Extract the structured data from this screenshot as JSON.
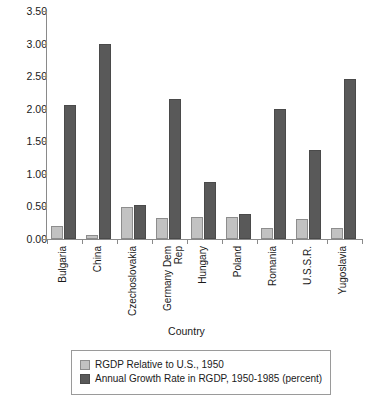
{
  "chart_data": {
    "type": "bar",
    "title": "",
    "xlabel": "Country",
    "ylabel": "",
    "ylim": [
      0.0,
      3.5
    ],
    "ytick_labels": [
      "0.00",
      "0.50",
      "1.00",
      "1.50",
      "2.00",
      "2.50",
      "3.00",
      "3.50"
    ],
    "ytick_values": [
      0.0,
      0.5,
      1.0,
      1.5,
      2.0,
      2.5,
      3.0,
      3.5
    ],
    "grid": false,
    "legend_position": "bottom",
    "categories": [
      "Bulgaria",
      "China",
      "Czechoslovakia",
      "Germany Dem Rep",
      "Hungary",
      "Poland",
      "Romania",
      "U.S.S.R.",
      "Yugoslavia"
    ],
    "series": [
      {
        "name": "RGDP Relative to U.S., 1950",
        "color": "#c2c2c2",
        "values": [
          0.2,
          0.06,
          0.49,
          0.33,
          0.34,
          0.34,
          0.17,
          0.31,
          0.17
        ]
      },
      {
        "name": "Annual Growth Rate in RGDP, 1950-1985 (percent)",
        "color": "#595959",
        "values": [
          2.05,
          3.0,
          0.52,
          2.15,
          0.87,
          0.39,
          1.99,
          1.37,
          2.45
        ]
      }
    ]
  },
  "legend": {
    "items": [
      {
        "label": "RGDP Relative to U.S., 1950"
      },
      {
        "label": "Annual Growth Rate in RGDP, 1950-1985 (percent)"
      }
    ]
  }
}
